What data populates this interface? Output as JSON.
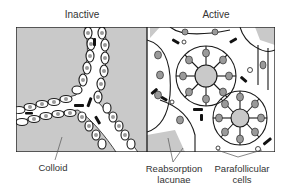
{
  "figure": {
    "panels": [
      {
        "id": "inactive",
        "title": "Inactive"
      },
      {
        "id": "active",
        "title": "Active"
      }
    ],
    "labels": [
      {
        "id": "colloid",
        "text": "Colloid"
      },
      {
        "id": "reabsorption-lacunae",
        "line1": "Reabsorption",
        "line2": "lacunae"
      },
      {
        "id": "parafollicular-cells",
        "line1": "Parafollicular",
        "line2": "cells"
      }
    ],
    "colors": {
      "colloid": "#c9c9c9",
      "background": "#ffffff",
      "outline": "#1a1a1a",
      "nucleus": "#9a9a9a",
      "capillary": "#111111"
    }
  }
}
